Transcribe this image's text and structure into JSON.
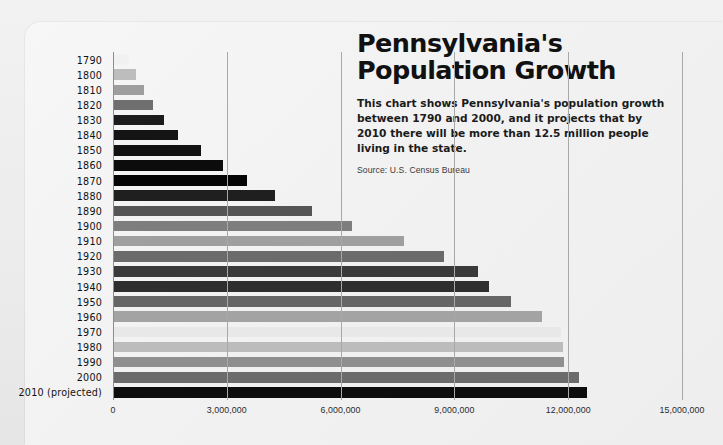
{
  "header": {
    "title": "Pennsylvania's\nPopulation Growth",
    "description": "This chart shows Pennsylvania's population growth between 1790 and 2000, and it projects that by 2010 there will be more than 12.5 million people living in the state.",
    "source": "Source: U.S. Census Bureau"
  },
  "chart_data": {
    "type": "bar",
    "orientation": "horizontal",
    "title": "Pennsylvania's Population Growth",
    "xlabel": "",
    "ylabel": "",
    "xlim": [
      0,
      15000000
    ],
    "grid": true,
    "legend": false,
    "xticks": [
      0,
      3000000,
      6000000,
      9000000,
      12000000,
      15000000
    ],
    "xtick_labels": [
      "0",
      "3,000,000",
      "6,000,000",
      "9,000,000",
      "12,000,000",
      "15,000,000"
    ],
    "categories": [
      "1790",
      "1800",
      "1810",
      "1820",
      "1830",
      "1840",
      "1850",
      "1860",
      "1870",
      "1880",
      "1890",
      "1900",
      "1910",
      "1920",
      "1930",
      "1940",
      "1950",
      "1960",
      "1970",
      "1980",
      "1990",
      "2000",
      "2010 (projected)"
    ],
    "values": [
      434373,
      602365,
      810091,
      1049458,
      1348233,
      1724033,
      2311786,
      2906215,
      3521951,
      4282891,
      5258113,
      6302115,
      7665111,
      8720017,
      9631350,
      9900180,
      10498012,
      11319366,
      11800766,
      11863895,
      11881643,
      12281054,
      12500000
    ],
    "bar_colors": [
      "#f1f1f1",
      "#bdbdbd",
      "#9e9e9e",
      "#6f6f6f",
      "#1c1c1c",
      "#141414",
      "#111111",
      "#0c0c0c",
      "#050505",
      "#1f1f1f",
      "#555555",
      "#7e7e7e",
      "#9f9f9f",
      "#6b6b6b",
      "#3a3a3a",
      "#2e2e2e",
      "#666666",
      "#a3a3a3",
      "#e8e8e8",
      "#bcbcbc",
      "#8f8f8f",
      "#6b6b6b",
      "#0d0d0d"
    ]
  }
}
